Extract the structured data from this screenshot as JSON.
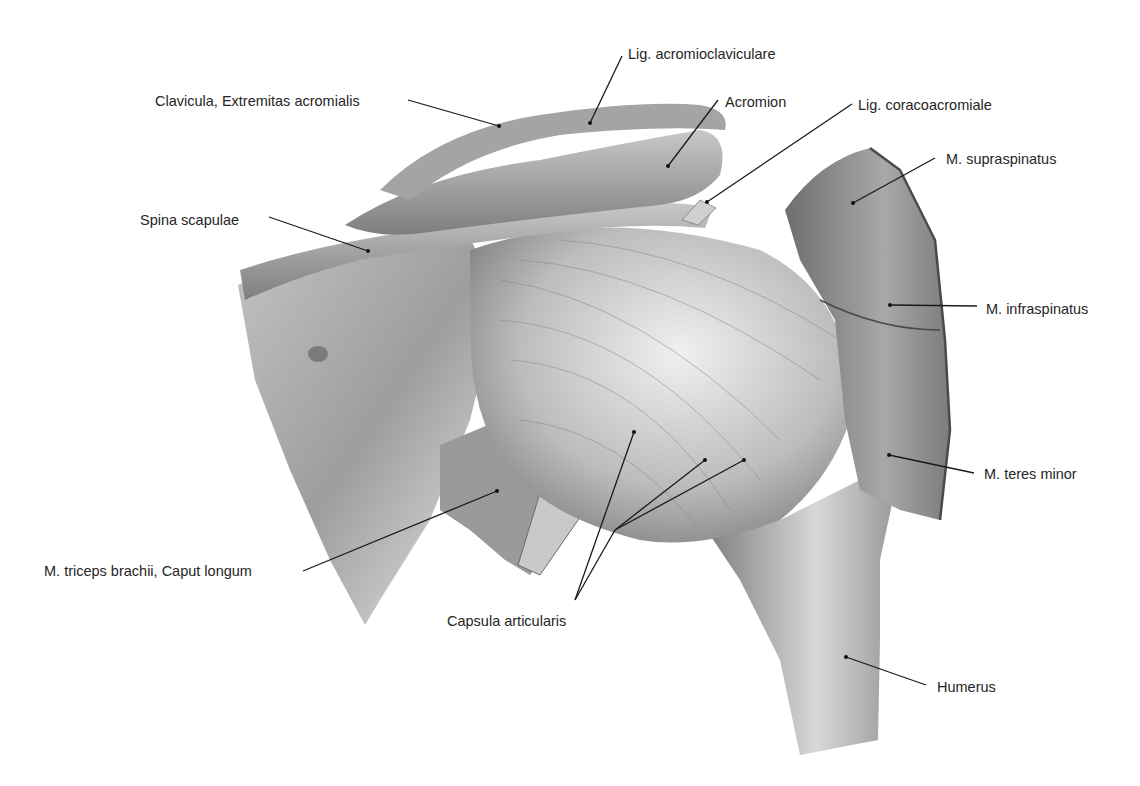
{
  "figure": {
    "labels": [
      {
        "id": "lig-acromioclaviculare",
        "text": "Lig. acromioclaviculare",
        "x": 628,
        "y": 46
      },
      {
        "id": "clavicula",
        "text": "Clavicula, Extremitas acromialis",
        "x": 155,
        "y": 93
      },
      {
        "id": "acromion",
        "text": "Acromion",
        "x": 725,
        "y": 94
      },
      {
        "id": "lig-coracoacromiale",
        "text": "Lig. coracoacromiale",
        "x": 858,
        "y": 97
      },
      {
        "id": "m-supraspinatus",
        "text": "M. supraspinatus",
        "x": 946,
        "y": 151
      },
      {
        "id": "spina-scapulae",
        "text": "Spina scapulae",
        "x": 140,
        "y": 212
      },
      {
        "id": "m-infraspinatus",
        "text": "M. infraspinatus",
        "x": 986,
        "y": 301
      },
      {
        "id": "m-teres-minor",
        "text": "M. teres minor",
        "x": 984,
        "y": 466
      },
      {
        "id": "m-triceps",
        "text": "M. triceps brachii, Caput longum",
        "x": 44,
        "y": 563
      },
      {
        "id": "capsula-articularis",
        "text": "Capsula articularis",
        "x": 447,
        "y": 613
      },
      {
        "id": "humerus",
        "text": "Humerus",
        "x": 937,
        "y": 679
      }
    ]
  }
}
